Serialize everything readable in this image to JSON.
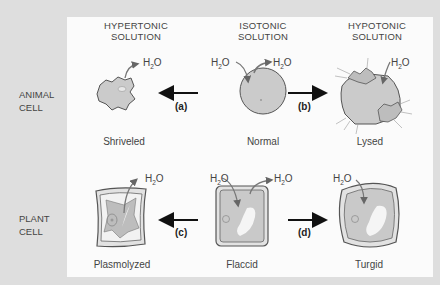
{
  "columns": [
    {
      "line1": "HYPERTONIC",
      "line2": "SOLUTION"
    },
    {
      "line1": "ISOTONIC",
      "line2": "SOLUTION"
    },
    {
      "line1": "HYPOTONIC",
      "line2": "SOLUTION"
    }
  ],
  "rows": [
    {
      "line1": "ANIMAL",
      "line2": "CELL"
    },
    {
      "line1": "PLANT",
      "line2": "CELL"
    }
  ],
  "captions": {
    "animal": [
      "Shriveled",
      "Normal",
      "Lysed"
    ],
    "plant": [
      "Plasmolyzed",
      "Flaccid",
      "Turgid"
    ]
  },
  "steps": {
    "a": "(a)",
    "b": "(b)",
    "c": "(c)",
    "d": "(d)"
  },
  "water": {
    "base": "H",
    "sub": "2",
    "tail": "O"
  },
  "colors": {
    "background": "#dedede",
    "panel": "#fbfbfb",
    "cell_fill": "#c9c9c9",
    "outline": "#555555"
  }
}
